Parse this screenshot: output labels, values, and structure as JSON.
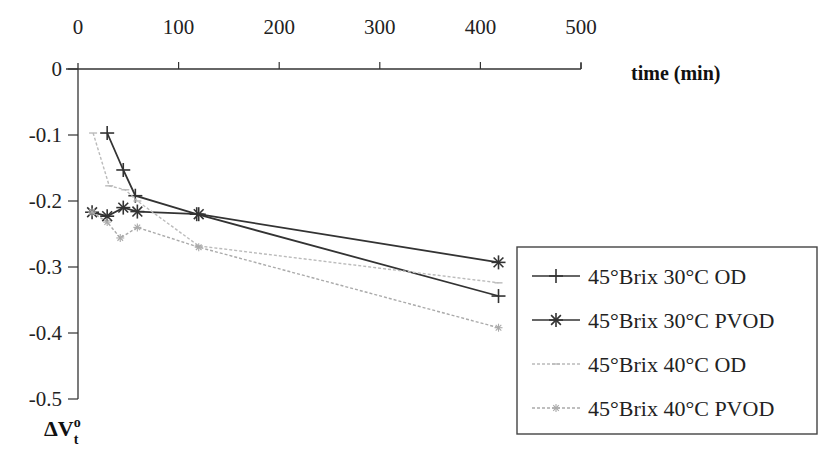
{
  "chart_data": {
    "type": "line",
    "title": "",
    "xlabel": "time (min)",
    "ylabel": "ΔV°t",
    "xlim": [
      0,
      500
    ],
    "ylim": [
      -0.5,
      0
    ],
    "x_ticks": [
      "0",
      "100",
      "200",
      "300",
      "400",
      "500"
    ],
    "y_ticks": [
      "0",
      "-0.1",
      "-0.2",
      "-0.3",
      "-0.4",
      "-0.5"
    ],
    "x_axis_position": "top",
    "grid": false,
    "legend_position": "lower right",
    "series": [
      {
        "name": "45°Brix 30°C OD",
        "marker": "+",
        "color": "#333333",
        "x": [
          29,
          45,
          57,
          118,
          418
        ],
        "y": [
          -0.097,
          -0.153,
          -0.192,
          -0.22,
          -0.344
        ]
      },
      {
        "name": "45°Brix 30°C PVOD",
        "marker": "*",
        "color": "#333333",
        "x": [
          14,
          29,
          45,
          59,
          120,
          418
        ],
        "y": [
          -0.217,
          -0.223,
          -0.21,
          -0.216,
          -0.22,
          -0.293
        ]
      },
      {
        "name": "45°Brix 40°C OD",
        "marker": "-",
        "color": "#bbbbbb",
        "x": [
          15,
          31,
          47,
          59,
          120,
          418
        ],
        "y": [
          -0.097,
          -0.177,
          -0.183,
          -0.2,
          -0.268,
          -0.324
        ]
      },
      {
        "name": "45°Brix 40°C PVOD",
        "marker": "x",
        "color": "#aaaaaa",
        "x": [
          14,
          29,
          42,
          59,
          120,
          418
        ],
        "y": [
          -0.217,
          -0.232,
          -0.256,
          -0.24,
          -0.27,
          -0.392
        ]
      }
    ]
  },
  "labels": {
    "x_axis_title": "time (min)",
    "y_axis_title_main": "ΔV",
    "y_axis_title_sup": "o",
    "y_axis_title_sub": "t"
  },
  "legend": {
    "items": [
      "45°Brix 30°C OD",
      "45°Brix 30°C PVOD",
      "45°Brix 40°C OD",
      "45°Brix 40°C PVOD"
    ]
  }
}
